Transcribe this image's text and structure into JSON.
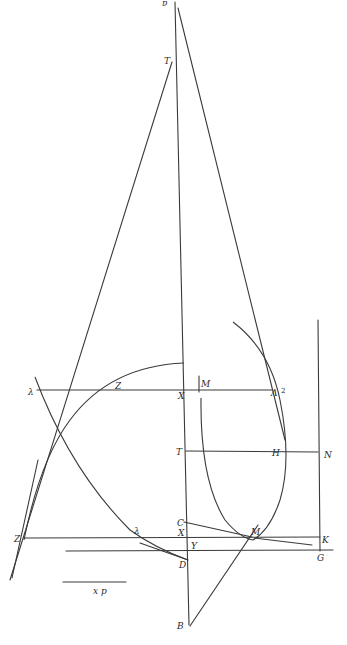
{
  "figure": {
    "orientation": "upside-down",
    "stroke_color": "#3a3a3a",
    "background": "#ffffff",
    "labels": {
      "top_apex": "ɐ",
      "upper_point": "T",
      "left_mid": "λ",
      "mid_z": "Z",
      "axis_x": "X",
      "mark_m": "M",
      "right_mid": "Λ",
      "right_mid_sup": "2",
      "axis_t": "T",
      "point_h": "H",
      "point_n": "N",
      "left_low": "Z",
      "low_lambda": "λ",
      "low_c": "C",
      "low_x": "X",
      "low_y": "Y",
      "low_d": "D",
      "point_m_low": "M",
      "right_k": "K",
      "right_g": "G",
      "scale_caption": "x p",
      "bottom_b": "B"
    }
  }
}
